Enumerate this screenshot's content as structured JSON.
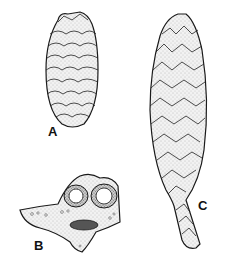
{
  "figure": {
    "panels": [
      {
        "label": "A",
        "subject": "ovoid seed cone, exterior view"
      },
      {
        "label": "B",
        "subject": "cross-section of cone scale with two seed cavities"
      },
      {
        "label": "C",
        "subject": "elongated cone on scaly stalk"
      }
    ],
    "colors": {
      "ink": "#1a1a1a",
      "paper": "#ffffff",
      "stipple": "#9a9a9a",
      "dark_fill": "#555555"
    }
  }
}
